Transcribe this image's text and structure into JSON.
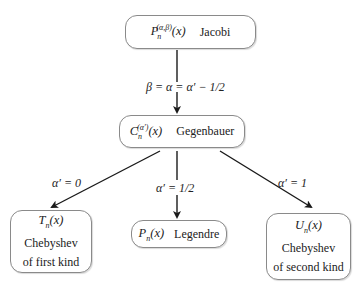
{
  "diagram": {
    "nodes": {
      "jacobi": {
        "symbol": "P",
        "sub": "n",
        "sup": "(α,β)",
        "arg": "(x)",
        "name": "Jacobi"
      },
      "gegenbauer": {
        "symbol": "C",
        "sub": "n",
        "sup": "(α′)",
        "arg": "(x)",
        "name": "Gegenbauer"
      },
      "chebyshev_first": {
        "symbol": "T",
        "sub": "n",
        "arg": "(x)",
        "line1": "Chebyshev",
        "line2": "of first kind"
      },
      "legendre": {
        "symbol": "P",
        "sub": "n",
        "arg": "(x)",
        "name": "Legendre"
      },
      "chebyshev_second": {
        "symbol": "U",
        "sub": "n",
        "arg": "(x)",
        "line1": "Chebyshev",
        "line2": "of second kind"
      }
    },
    "edges": {
      "jacobi_to_gegenbauer": "β = α = α′ − 1/2",
      "to_chebyshev_first": "α′ = 0",
      "to_legendre": "α′ = 1/2",
      "to_chebyshev_second": "α′ = 1"
    },
    "colors": {
      "border": "#8a8a8a",
      "arrow": "#1a1a1a",
      "text": "#222222"
    }
  }
}
